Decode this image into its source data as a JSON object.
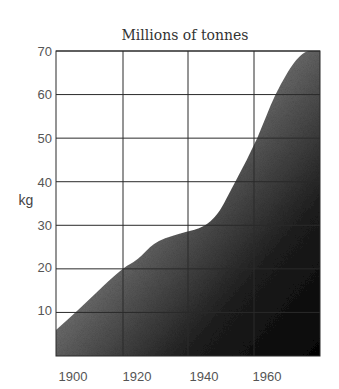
{
  "chart_data": {
    "type": "area",
    "title": "Millions of tonnes",
    "xlabel": "",
    "ylabel": "kg",
    "x_ticks": [
      1900,
      1920,
      1940,
      1960
    ],
    "y_ticks": [
      10,
      20,
      30,
      40,
      50,
      60,
      70
    ],
    "xlim": [
      1895,
      1976
    ],
    "ylim": [
      0,
      70
    ],
    "grid": true,
    "legend": null,
    "fill": "gradient-grey-to-black (stippled)",
    "series": [
      {
        "name": "Millions of tonnes",
        "x": [
          1895,
          1901,
          1915,
          1920,
          1925,
          1932,
          1943,
          1950,
          1957,
          1962,
          1970,
          1976
        ],
        "values": [
          6,
          10,
          20,
          22,
          26,
          28,
          30,
          40,
          50,
          60,
          70,
          70
        ]
      }
    ]
  },
  "labels": {
    "title": "Millions of tonnes",
    "ylabel": "kg",
    "x_tick_labels": [
      "1900",
      "1920",
      "1940",
      "1960"
    ],
    "y_tick_labels": [
      "10",
      "20",
      "30",
      "40",
      "50",
      "60",
      "70"
    ]
  },
  "colors": {
    "fill_light": "#d8d8d8",
    "fill_dark": "#0a0a0a",
    "grid": "#2a2a2a",
    "text": "#555555"
  }
}
